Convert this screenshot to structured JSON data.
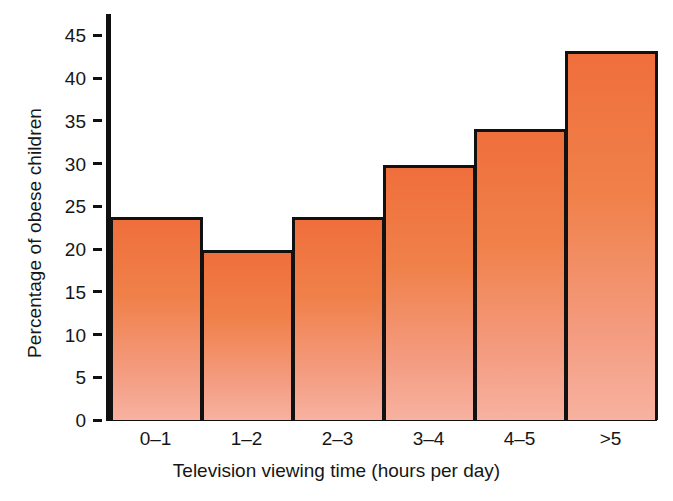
{
  "chart_data": {
    "type": "bar",
    "title": "",
    "subtitle": "",
    "xlabel": "Television viewing time (hours per day)",
    "ylabel": "Percentage of obese children",
    "categories": [
      "0–1",
      "1–2",
      "2–3",
      "3–4",
      "4–5",
      ">5"
    ],
    "values": [
      23.7,
      19.9,
      23.8,
      29.8,
      34.0,
      43.2
    ],
    "series": [
      {
        "name": "Percentage of obese children",
        "values": [
          23.7,
          19.9,
          23.8,
          29.8,
          34.0,
          43.2
        ]
      }
    ],
    "yticks": [
      0,
      5,
      10,
      15,
      20,
      25,
      30,
      35,
      40,
      45
    ],
    "ytick_labels": [
      "0",
      "5",
      "10",
      "15",
      "20",
      "25",
      "30",
      "35",
      "40",
      "45"
    ],
    "ylim": [
      0,
      47.5
    ],
    "xlim": [
      0,
      6
    ],
    "grid": false,
    "legend": false,
    "legend_position": "none",
    "bar_style": "histogram-contiguous",
    "colors": {
      "bar_fill_top": "#ef6f3c",
      "bar_fill_bottom": "#f7b2a0",
      "bar_edge": "#111111",
      "axis": "#101010",
      "text": "#161616",
      "background": "#ffffff"
    },
    "annotations": []
  }
}
